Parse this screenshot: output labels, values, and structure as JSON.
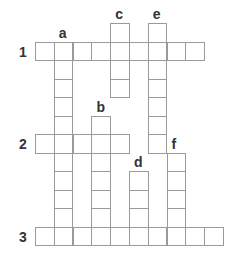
{
  "puzzle": {
    "origin_x": 35,
    "origin_y": 23,
    "cell_w": 18.8,
    "cell_h": 18.5,
    "across": [
      {
        "label": "1",
        "row": 1,
        "col": 0,
        "length": 9
      },
      {
        "label": "2",
        "row": 6,
        "col": 0,
        "length": 5
      },
      {
        "label": "3",
        "row": 11,
        "col": 0,
        "length": 10
      }
    ],
    "down": [
      {
        "label": "a",
        "row": 1,
        "col": 1,
        "length": 11
      },
      {
        "label": "b",
        "row": 5,
        "col": 3,
        "length": 7
      },
      {
        "label": "c",
        "row": 0,
        "col": 4,
        "length": 4
      },
      {
        "label": "d",
        "row": 8,
        "col": 5,
        "length": 4
      },
      {
        "label": "e",
        "row": 0,
        "col": 6,
        "length": 7
      },
      {
        "label": "f",
        "row": 7,
        "col": 7,
        "length": 5
      }
    ]
  }
}
